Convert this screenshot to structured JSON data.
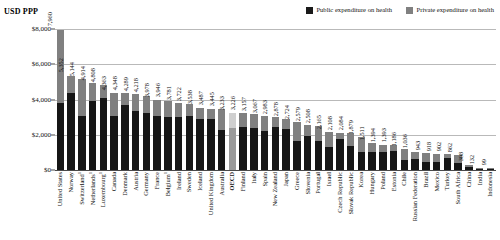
{
  "axis_title": "USD PPP",
  "legend": {
    "position": "top-right",
    "items": [
      {
        "label": "Public expenditure on health",
        "color": "#161616",
        "key": "public"
      },
      {
        "label": "Private expenditure on health",
        "color": "#808080",
        "key": "private"
      }
    ]
  },
  "yaxis": {
    "ticks": [
      "$0",
      "$2,000",
      "$4,000",
      "$6,000",
      "$8,000"
    ],
    "tick_values": [
      0,
      2000,
      4000,
      6000,
      8000
    ]
  },
  "chart_data": {
    "type": "bar",
    "title": "",
    "subtitle": "",
    "xlabel": "",
    "ylabel": "USD PPP",
    "ylim": [
      0,
      8400
    ],
    "grid": true,
    "stacked": true,
    "legend_position": "top-right",
    "categories": [
      "United States",
      "Norway",
      "Switzerland¹",
      "Netherlands¹",
      "Luxembourg¹",
      "Canada",
      "Denmark",
      "Austria",
      "Germany",
      "France",
      "Belgium¹",
      "Ireland",
      "Sweden",
      "Iceland",
      "United Kingdom",
      "Australia",
      "OECD",
      "Finland",
      "Italy",
      "Spain",
      "New Zealand",
      "Japan",
      "Greece",
      "Slovenia",
      "Portugal",
      "Israel",
      "Czech Republic",
      "Slovak Republic",
      "Korea",
      "Hungary",
      "Poland",
      "Estonia",
      "Chile",
      "Russian Federation",
      "Brazil",
      "Mexico",
      "Turkey",
      "South Africa",
      "China",
      "India",
      "Indonesia"
    ],
    "values": [
      7960,
      5352,
      5144,
      4914,
      4808,
      4363,
      4348,
      4289,
      4218,
      3978,
      3946,
      3781,
      3722,
      3538,
      3487,
      3445,
      3233,
      3226,
      3157,
      3067,
      2983,
      2878,
      2724,
      2579,
      2508,
      2165,
      2108,
      2084,
      1879,
      1511,
      1394,
      1393,
      1186,
      1036,
      943,
      918,
      902,
      862,
      308,
      132,
      99
    ],
    "series": [
      {
        "name": "Public expenditure on health",
        "color": "#161616",
        "values": [
          3795,
          4382,
          3086,
          3929,
          4087,
          3083,
          3696,
          3324,
          3247,
          3069,
          2999,
          3004,
          3044,
          2873,
          2875,
          2298,
          2364,
          2457,
          2406,
          2192,
          2440,
          2346,
          1646,
          1926,
          1626,
          1291,
          1735,
          1361,
          1013,
          1032,
          1000,
          1061,
          558,
          640,
          444,
          450,
          675,
          379,
          168,
          40,
          37
        ]
      },
      {
        "name": "Private expenditure on health",
        "color": "#808080",
        "values": [
          4165,
          970,
          2058,
          985,
          721,
          1280,
          652,
          965,
          971,
          909,
          947,
          777,
          678,
          665,
          612,
          1147,
          869,
          769,
          751,
          875,
          543,
          532,
          1078,
          653,
          882,
          874,
          373,
          723,
          866,
          479,
          394,
          332,
          628,
          396,
          499,
          468,
          227,
          483,
          140,
          92,
          62
        ]
      }
    ],
    "highlight_category": "OECD",
    "highlight_colors": {
      "public": "#9a9a9a",
      "private": "#cfcfcf"
    }
  }
}
